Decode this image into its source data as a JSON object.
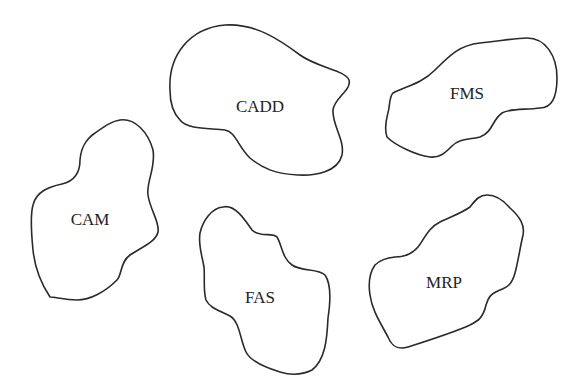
{
  "diagram": {
    "type": "isolated-islands",
    "stroke_color": "#2a2a2a",
    "background": "#ffffff",
    "regions": [
      {
        "id": "cadd",
        "label": "CADD",
        "label_x": 260,
        "label_y": 112
      },
      {
        "id": "fms",
        "label": "FMS",
        "label_x": 467,
        "label_y": 99
      },
      {
        "id": "cam",
        "label": "CAM",
        "label_x": 90,
        "label_y": 225
      },
      {
        "id": "fas",
        "label": "FAS",
        "label_x": 260,
        "label_y": 303
      },
      {
        "id": "mrp",
        "label": "MRP",
        "label_x": 444,
        "label_y": 288
      }
    ]
  }
}
